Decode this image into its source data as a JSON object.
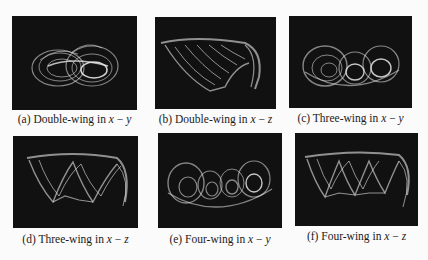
{
  "figure": {
    "panels": [
      {
        "id": "a",
        "label": "(a)",
        "title": "Double-wing in",
        "var1": "x",
        "op": "−",
        "var2": "y",
        "wings": 2,
        "plane": "x-y"
      },
      {
        "id": "b",
        "label": "(b)",
        "title": "Double-wing in",
        "var1": "x",
        "op": "−",
        "var2": "z",
        "wings": 2,
        "plane": "x-z"
      },
      {
        "id": "c",
        "label": "(c)",
        "title": "Three-wing in",
        "var1": "x",
        "op": "−",
        "var2": "y",
        "wings": 3,
        "plane": "x-y"
      },
      {
        "id": "d",
        "label": "(d)",
        "title": "Three-wing in",
        "var1": "x",
        "op": "−",
        "var2": "z",
        "wings": 3,
        "plane": "x-z"
      },
      {
        "id": "e",
        "label": "(e)",
        "title": "Four-wing in",
        "var1": "x",
        "op": "−",
        "var2": "y",
        "wings": 4,
        "plane": "x-y"
      },
      {
        "id": "f",
        "label": "(f)",
        "title": "Four-wing in",
        "var1": "x",
        "op": "−",
        "var2": "z",
        "wings": 4,
        "plane": "x-z"
      }
    ],
    "colors": {
      "background": "#111111",
      "trace": "#e8e8e8",
      "page": "#fbfbfb"
    }
  }
}
